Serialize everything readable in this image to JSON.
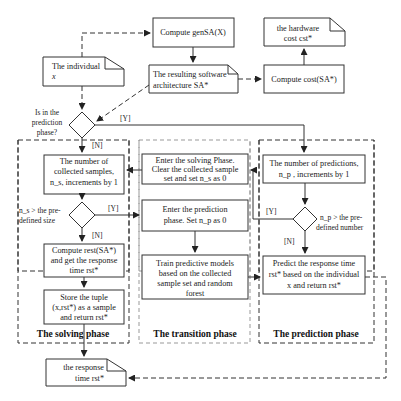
{
  "nodes": {
    "compute_gensa": "Compute genSA(X)",
    "individual": [
      "The individual",
      "x"
    ],
    "resulting_sa": [
      "The resulting software",
      "architecture SA*"
    ],
    "hardware_cost": [
      "the hardware",
      "cost cst*"
    ],
    "compute_cost": "Compute cost(SA*)",
    "decision_prediction": [
      "Is in the",
      "prediction",
      "phase?"
    ],
    "num_samples": [
      "The number of",
      "collected samples,",
      "n_s, increments by 1"
    ],
    "decision_size": [
      "n_s > the pre-",
      "defined size"
    ],
    "compute_rest": [
      "Compute rest(SA*)",
      "and get the response",
      "time rst*"
    ],
    "store_tuple": [
      "Store the tuple",
      "(x,rst*) as a sample",
      "and return rst*"
    ],
    "enter_solving": [
      "Enter the solving Phase.",
      "Clear the collected sample",
      "set and set n_s as 0"
    ],
    "enter_prediction": [
      "Enter the prediction",
      "phase.  Set n_p as  0"
    ],
    "train_models": [
      "Train predictive models",
      "based on the collected",
      "sample set and  random",
      "forest"
    ],
    "num_predictions": [
      "The number of predictions,",
      "n_p , increments by 1"
    ],
    "decision_number": [
      "n_p > the pre-",
      "defined number"
    ],
    "predict_rt": [
      "Predict the response time",
      "rst* based on the individual",
      "x  and return rst*"
    ],
    "response_time": [
      "the response",
      "time rst*"
    ]
  },
  "edge_labels": {
    "yes": "[Y]",
    "no": "[N]"
  },
  "phases": {
    "solving": "The  solving    phase",
    "transition": "The transition phase",
    "prediction": "The prediction phase"
  }
}
